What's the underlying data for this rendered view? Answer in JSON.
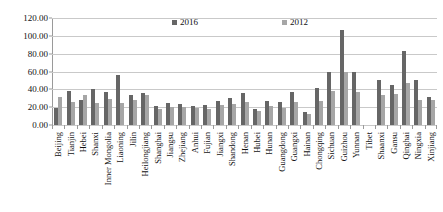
{
  "chart_data": {
    "type": "bar",
    "title": "",
    "subtitle": "",
    "xlabel": "",
    "ylabel": "",
    "ylim": [
      0,
      120
    ],
    "ytick_labels": [
      "0.00",
      "20.00",
      "40.00",
      "60.00",
      "80.00",
      "100.00",
      "120.00"
    ],
    "ytick_values": [
      0,
      20,
      40,
      60,
      80,
      100,
      120
    ],
    "grid": true,
    "legend_position": "top-center",
    "colors": {
      "y2016": "#666666",
      "y2012": "#a6a6a6"
    },
    "categories": [
      "Beijing",
      "Tianjin",
      "Hebei",
      "Shanxi",
      "Inner Mongolia",
      "Liaoning",
      "Jilin",
      "Heilongjiang",
      "Shanghai",
      "Jiangsu",
      "Zhejiang",
      "Anhui",
      "Fujian",
      "Jiangxi",
      "Shandong",
      "Henan",
      "Hubei",
      "Hunan",
      "Guangdong",
      "Guangxi",
      "Hainan",
      "Chongqing",
      "Sichuan",
      "Guizhou",
      "Yunnan",
      "Tibet",
      "Shaanxi",
      "Gansu",
      "Qinghai",
      "Ningxia",
      "Xinjiang"
    ],
    "series": [
      {
        "name": "2016",
        "values": [
          19.5,
          38.5,
          28.5,
          40.0,
          37.5,
          56.0,
          34.0,
          35.5,
          21.5,
          24.5,
          24.0,
          21.5,
          22.0,
          27.0,
          30.5,
          35.5,
          18.0,
          27.0,
          25.5,
          37.5,
          14.5,
          42.0,
          60.0,
          106.0,
          60.0,
          0.0,
          50.0,
          45.0,
          83.0,
          50.5,
          31.5
        ]
      },
      {
        "name": "2012",
        "values": [
          31.5,
          25.5,
          33.5,
          25.0,
          29.0,
          25.0,
          27.5,
          33.5,
          18.0,
          20.5,
          20.5,
          19.0,
          18.5,
          23.0,
          24.0,
          26.0,
          15.5,
          21.5,
          19.5,
          26.0,
          12.0,
          26.5,
          38.5,
          60.0,
          37.0,
          0.0,
          34.0,
          35.0,
          47.0,
          28.0,
          28.5
        ]
      }
    ],
    "legend": [
      {
        "label": "2016",
        "color": "#666666"
      },
      {
        "label": "2012",
        "color": "#a6a6a6"
      }
    ]
  }
}
